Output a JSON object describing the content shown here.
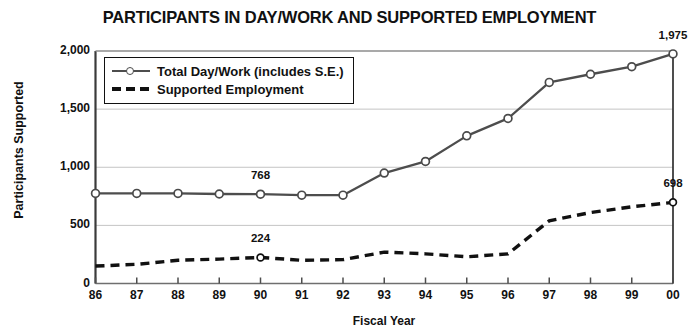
{
  "chart_data": {
    "type": "line",
    "title": "PARTICIPANTS IN DAY/WORK AND SUPPORTED EMPLOYMENT",
    "xlabel": "Fiscal Year",
    "ylabel": "Participants Supported",
    "categories": [
      "86",
      "87",
      "88",
      "89",
      "90",
      "91",
      "92",
      "93",
      "94",
      "95",
      "96",
      "97",
      "98",
      "99",
      "00"
    ],
    "ylim": [
      0,
      2000
    ],
    "yticks": [
      0,
      500,
      1000,
      1500,
      2000
    ],
    "ytick_labels": [
      "0",
      "500",
      "1,000",
      "1,500",
      "2,000"
    ],
    "grid": "horizontal",
    "legend_position": "top-left-inside",
    "series": [
      {
        "name": "Total Day/Work (includes S.E.)",
        "style": "solid-with-circle-markers",
        "color": "#4d4d4d",
        "values": [
          775,
          775,
          775,
          770,
          768,
          760,
          760,
          950,
          1050,
          1270,
          1420,
          1730,
          1800,
          1865,
          1975
        ]
      },
      {
        "name": "Supported Employment",
        "style": "dashed",
        "color": "#111111",
        "values": [
          150,
          165,
          200,
          210,
          224,
          200,
          205,
          270,
          255,
          230,
          255,
          540,
          610,
          660,
          698
        ]
      }
    ],
    "annotations": [
      {
        "text": "1,975",
        "series": 0,
        "category": "00",
        "value": 1975
      },
      {
        "text": "768",
        "series": 0,
        "category": "90",
        "value": 768
      },
      {
        "text": "698",
        "series": 1,
        "category": "00",
        "value": 698
      },
      {
        "text": "224",
        "series": 1,
        "category": "90",
        "value": 224
      }
    ]
  },
  "legend": {
    "items": [
      {
        "label": "Total Day/Work (includes S.E.)"
      },
      {
        "label": "Supported Employment"
      }
    ]
  }
}
